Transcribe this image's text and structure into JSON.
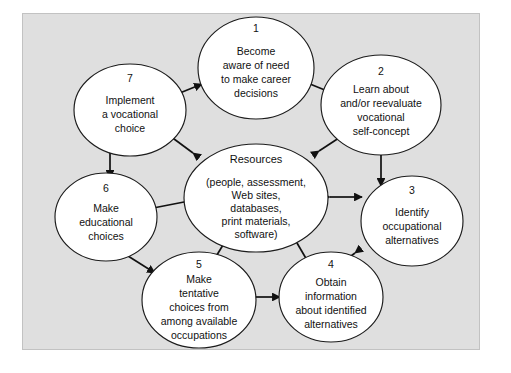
{
  "diagram": {
    "type": "cycle-with-hub",
    "frame": {
      "background_color": "#dfdfdf",
      "border_color": "#c2c2c2"
    },
    "hub": {
      "title": "Resources",
      "lines": [
        "(people, assessment,",
        "Web sites,",
        "databases,",
        "print materials,",
        "software)"
      ]
    },
    "nodes": [
      {
        "number": "1",
        "lines": [
          "Become",
          "aware of need",
          "to make career",
          "decisions"
        ]
      },
      {
        "number": "2",
        "lines": [
          "Learn about",
          "and/or reevaluate",
          "vocational",
          "self-concept"
        ]
      },
      {
        "number": "3",
        "lines": [
          "Identify",
          "occupational",
          "alternatives"
        ]
      },
      {
        "number": "4",
        "lines": [
          "Obtain",
          "information",
          "about identified",
          "alternatives"
        ]
      },
      {
        "number": "5",
        "lines": [
          "Make",
          "tentative",
          "choices from",
          "among available",
          "occupations"
        ]
      },
      {
        "number": "6",
        "lines": [
          "Make",
          "educational",
          "choices"
        ]
      },
      {
        "number": "7",
        "lines": [
          "Implement",
          "a vocational",
          "choice"
        ]
      }
    ],
    "connector_style": "double-headed-arrow",
    "connector_color": "#111111"
  }
}
